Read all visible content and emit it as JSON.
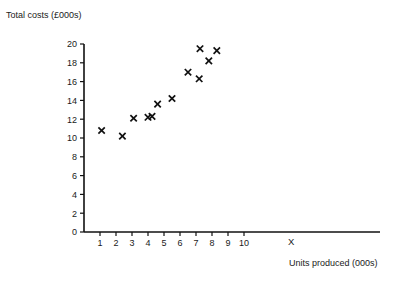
{
  "chart_data": {
    "type": "scatter",
    "title": "",
    "ylabel": "Total costs (£000s)",
    "xlabel": "Units produced (000s)",
    "x_axis_symbol": "X",
    "xlim": [
      0,
      10.9
    ],
    "ylim": [
      0,
      20
    ],
    "grid": false,
    "legend": "none",
    "x_ticks": [
      "1",
      "2",
      "3",
      "4",
      "5",
      "6",
      "7",
      "8",
      "9",
      "10"
    ],
    "x_tick_values": [
      1,
      2,
      3,
      4,
      5,
      6,
      7,
      8,
      9,
      10
    ],
    "y_ticks": [
      "0",
      "2",
      "4",
      "6",
      "8",
      "10",
      "12",
      "14",
      "16",
      "18",
      "20"
    ],
    "y_tick_values": [
      0,
      2,
      4,
      6,
      8,
      10,
      12,
      14,
      16,
      18,
      20
    ],
    "marker": "x",
    "marker_color": "#111111",
    "points": [
      {
        "x": 1.1,
        "y": 10.8
      },
      {
        "x": 2.4,
        "y": 10.2
      },
      {
        "x": 3.1,
        "y": 12.1
      },
      {
        "x": 4.0,
        "y": 12.2
      },
      {
        "x": 4.25,
        "y": 12.3
      },
      {
        "x": 4.6,
        "y": 13.6
      },
      {
        "x": 5.5,
        "y": 14.2
      },
      {
        "x": 6.5,
        "y": 17.0
      },
      {
        "x": 7.2,
        "y": 16.3
      },
      {
        "x": 7.25,
        "y": 19.5
      },
      {
        "x": 7.8,
        "y": 18.2
      },
      {
        "x": 8.3,
        "y": 19.3
      }
    ]
  },
  "labels": {
    "y_axis_title": "Total costs (£000s)",
    "x_axis_title": "Units produced (000s)",
    "x_axis_symbol": "X"
  }
}
